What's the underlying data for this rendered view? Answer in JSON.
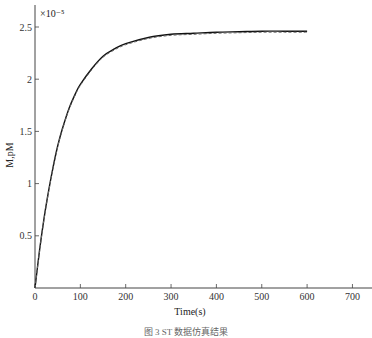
{
  "chart_data": {
    "type": "line",
    "title": "",
    "xlabel": "Time(s)",
    "ylabel": "M,pM",
    "y_multiplier": "×10⁻⁵",
    "xlim": [
      0,
      730
    ],
    "ylim": [
      0,
      2.7
    ],
    "xticks": [
      0,
      100,
      200,
      300,
      400,
      500,
      600,
      700
    ],
    "xtick_labels": [
      "0",
      "100",
      "200",
      "300",
      "400",
      "500",
      "600",
      "700"
    ],
    "yticks": [
      0.5,
      1,
      1.5,
      2,
      2.5
    ],
    "ytick_labels": [
      "0.5",
      "1",
      "1.5",
      "2",
      "2.5"
    ],
    "grid": false,
    "legend": null,
    "x": [
      0,
      10,
      20,
      30,
      40,
      50,
      60,
      75,
      90,
      100,
      125,
      150,
      175,
      200,
      250,
      300,
      350,
      400,
      450,
      500,
      550,
      600
    ],
    "series": [
      {
        "name": "simulated",
        "style": "solid",
        "color": "#111111",
        "values": [
          0,
          0.36,
          0.67,
          0.93,
          1.16,
          1.36,
          1.52,
          1.72,
          1.87,
          1.95,
          2.1,
          2.22,
          2.29,
          2.34,
          2.4,
          2.43,
          2.44,
          2.45,
          2.455,
          2.46,
          2.46,
          2.46
        ]
      },
      {
        "name": "measured",
        "style": "dashed",
        "color": "#666666",
        "values": [
          0,
          0.35,
          0.66,
          0.92,
          1.15,
          1.35,
          1.51,
          1.71,
          1.86,
          1.94,
          2.09,
          2.21,
          2.28,
          2.33,
          2.39,
          2.42,
          2.43,
          2.44,
          2.445,
          2.45,
          2.45,
          2.45
        ]
      }
    ]
  },
  "caption": "图 3  ST   数据仿真结果"
}
